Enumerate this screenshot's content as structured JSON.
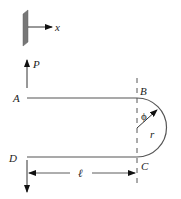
{
  "diagram": {
    "type": "mechanics-free-body",
    "axis": {
      "label": "x"
    },
    "points": {
      "A": "A",
      "B": "B",
      "C": "C",
      "D": "D"
    },
    "load": {
      "label": "P"
    },
    "angle": {
      "label": "ϕ"
    },
    "radius": {
      "label": "r"
    },
    "length": {
      "label": "ℓ"
    },
    "colors": {
      "line": "#555555",
      "wall": "#777777",
      "arrow": "#111111"
    }
  }
}
